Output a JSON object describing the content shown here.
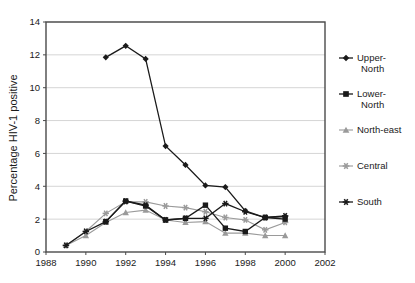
{
  "chart_data": {
    "type": "line",
    "title": "",
    "xlabel": "",
    "ylabel": "Percentage HIV-1 positive",
    "xlim": [
      1988,
      2002
    ],
    "ylim": [
      0,
      14
    ],
    "xticks": [
      1988,
      1990,
      1992,
      1994,
      1996,
      1998,
      2000,
      2002
    ],
    "yticks": [
      0,
      2,
      4,
      6,
      8,
      10,
      12,
      14
    ],
    "grid": "horizontal",
    "legend_position": "right",
    "series": [
      {
        "name": "Upper-North",
        "legend_label_line1": "Upper-",
        "legend_label_line2": "North",
        "color": "#1a1a1a",
        "marker": "diamond",
        "x": [
          1991,
          1992,
          1993,
          1994,
          1995,
          1996,
          1997,
          1998,
          1999,
          2000
        ],
        "values": [
          11.85,
          12.55,
          11.75,
          6.45,
          5.3,
          4.05,
          3.95,
          2.5,
          2.1,
          2.15
        ]
      },
      {
        "name": "Lower-North",
        "legend_label_line1": "Lower-",
        "legend_label_line2": "North",
        "color": "#1a1a1a",
        "marker": "square",
        "x": [
          1991,
          1992,
          1993,
          1994,
          1995,
          1996,
          1997,
          1998,
          1999,
          2000
        ],
        "values": [
          1.85,
          3.1,
          2.8,
          1.95,
          2.05,
          2.85,
          1.45,
          1.25,
          2.1,
          2.0
        ]
      },
      {
        "name": "North-east",
        "legend_label_line1": "North-east",
        "legend_label_line2": "",
        "color": "#9a9a9a",
        "marker": "triangle",
        "x": [
          1989,
          1990,
          1991,
          1992,
          1993,
          1994,
          1995,
          1996,
          1997,
          1998,
          1999,
          2000
        ],
        "values": [
          0.4,
          1.0,
          1.8,
          2.4,
          2.55,
          1.95,
          1.8,
          1.85,
          1.15,
          1.15,
          1.0,
          1.0
        ]
      },
      {
        "name": "Central",
        "legend_label_line1": "Central",
        "legend_label_line2": "",
        "color": "#9a9a9a",
        "marker": "asterisk",
        "x": [
          1989,
          1990,
          1991,
          1992,
          1993,
          1994,
          1995,
          1996,
          1997,
          1998,
          1999,
          2000
        ],
        "values": [
          0.4,
          1.25,
          2.35,
          3.05,
          3.05,
          2.8,
          2.7,
          2.45,
          2.1,
          1.95,
          1.35,
          1.8
        ]
      },
      {
        "name": "South",
        "legend_label_line1": "South",
        "legend_label_line2": "",
        "color": "#1a1a1a",
        "marker": "asterisk",
        "x": [
          1989,
          1990,
          1991,
          1992,
          1993,
          1994,
          1995,
          1996,
          1997,
          1998,
          1999,
          2000
        ],
        "values": [
          0.4,
          1.25,
          1.85,
          3.1,
          2.85,
          1.95,
          2.05,
          2.05,
          2.95,
          2.45,
          2.1,
          2.2
        ]
      }
    ]
  },
  "axes": {
    "y_title": "Percentage HIV-1 positive"
  },
  "colors": {
    "dark": "#1a1a1a",
    "gray": "#9a9a9a",
    "grid": "#d5d5d5",
    "frame": "#4a4a4a",
    "background": "#ffffff"
  }
}
